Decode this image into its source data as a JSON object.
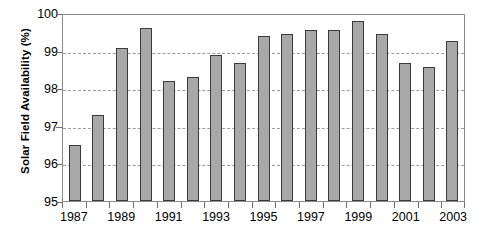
{
  "chart_data": {
    "type": "bar",
    "title": "",
    "xlabel": "",
    "ylabel": "Solar Field Availability (%)",
    "ylim": [
      95,
      100
    ],
    "ytick_labels": [
      "95",
      "96",
      "97",
      "98",
      "99",
      "100"
    ],
    "ytick_values": [
      95,
      96,
      97,
      98,
      99,
      100
    ],
    "gridlines": [
      96,
      97,
      98,
      99
    ],
    "grid": true,
    "legend": "none",
    "categories": [
      "1987",
      "1988",
      "1989",
      "1990",
      "1991",
      "1992",
      "1993",
      "1994",
      "1995",
      "1996",
      "1997",
      "1998",
      "1999",
      "2000",
      "2001",
      "2002",
      "2003"
    ],
    "xtick_labels_shown": [
      "1987",
      "1989",
      "1991",
      "1993",
      "1995",
      "1997",
      "1999",
      "2001",
      "2003"
    ],
    "values": [
      96.5,
      97.3,
      99.07,
      99.6,
      98.2,
      98.3,
      98.88,
      98.68,
      99.38,
      99.45,
      99.55,
      99.55,
      99.78,
      99.45,
      98.68,
      98.57,
      99.25
    ],
    "bar_color": "#a8a8a8",
    "bar_border_color": "#3a3a3a",
    "grid_color": "#9c9c9c",
    "axis_color": "#8a8a8a",
    "background": "#ffffff"
  }
}
